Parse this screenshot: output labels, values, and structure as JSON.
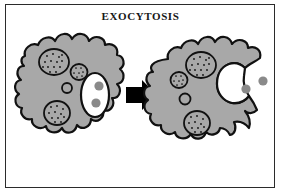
{
  "figure": {
    "title": "EXOCYTOSIS",
    "type": "biology-process-diagram",
    "canvas": {
      "width": 281,
      "height": 195
    },
    "background_color": "#ffffff",
    "border_color": "#2b2b2b"
  },
  "palette": {
    "cytoplasm_gray": "#a8a8a8",
    "outline_black": "#111111",
    "vesicle_white": "#ffffff",
    "particle_gray": "#8a8a8a",
    "stipple_dot": "#111111",
    "arrow_black": "#000000"
  },
  "panels": [
    {
      "id": "before",
      "label": "cell-before-exocytosis",
      "caption": "",
      "organelles": [
        {
          "name": "large-stippled-organelle-upper",
          "style": "stippled",
          "dots": 14
        },
        {
          "name": "small-stippled-organelle",
          "style": "stippled",
          "dots": 7
        },
        {
          "name": "plain-small-vesicle",
          "style": "plain",
          "dots": 0
        },
        {
          "name": "large-stippled-organelle-lower",
          "style": "stippled",
          "dots": 11
        }
      ],
      "secretory_vesicle": {
        "name": "secretory-vesicle-intact",
        "state": "intact-inside-cell",
        "fill": "#ffffff",
        "particles": 2
      },
      "released_particles": 0
    },
    {
      "id": "after",
      "label": "cell-after-exocytosis",
      "caption": "",
      "organelles": [
        {
          "name": "large-stippled-organelle-upper",
          "style": "stippled",
          "dots": 14
        },
        {
          "name": "small-stippled-organelle",
          "style": "stippled",
          "dots": 7
        },
        {
          "name": "plain-small-vesicle",
          "style": "plain",
          "dots": 0
        },
        {
          "name": "large-stippled-organelle-lower",
          "style": "stippled",
          "dots": 11
        }
      ],
      "secretory_vesicle": {
        "name": "secretory-vesicle-fused",
        "state": "fused-with-membrane-open-to-exterior",
        "fill": "#ffffff",
        "particles": 0
      },
      "released_particles": 2
    }
  ],
  "arrow": {
    "name": "process-arrow",
    "direction": "right",
    "color": "#000000"
  }
}
